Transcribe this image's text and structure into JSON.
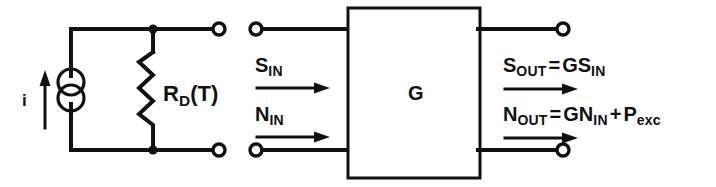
{
  "diagram": {
    "type": "circuit-schematic",
    "source_section": {
      "current_label": "i",
      "current_arrow_direction": "up",
      "source_symbol": "current-source-double-circle",
      "resistor_label_main": "R",
      "resistor_label_sub": "D",
      "resistor_label_arg": "(T)",
      "resistor_label_full": "R_D(T)"
    },
    "amplifier": {
      "label": "G"
    },
    "inputs": [
      {
        "name": "signal-in",
        "main": "S",
        "sub": "IN",
        "full": "S_IN",
        "arrow_direction": "right"
      },
      {
        "name": "noise-in",
        "main": "N",
        "sub": "IN",
        "full": "N_IN",
        "arrow_direction": "right"
      }
    ],
    "outputs": [
      {
        "name": "signal-out",
        "main": "S",
        "sub": "OUT",
        "operator": "=",
        "rhs_main": "GS",
        "rhs_sub": "IN",
        "full": "S_OUT = GS_IN",
        "arrow_direction": "right"
      },
      {
        "name": "noise-out",
        "main": "N",
        "sub": "OUT",
        "operator": "=",
        "rhs_main": "GN",
        "rhs_sub": "IN",
        "plus": "+",
        "extra_main": "P",
        "extra_sub": "exc",
        "full": "N_OUT = GN_IN + P_exc",
        "arrow_direction": "right"
      }
    ],
    "colors": {
      "ink": "#111111",
      "background": "#ffffff"
    }
  }
}
